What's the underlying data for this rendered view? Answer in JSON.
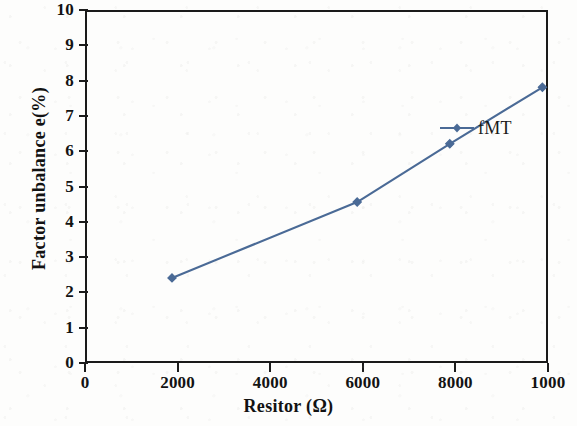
{
  "chart_data": {
    "type": "line",
    "title": "",
    "xlabel": "Resitor (Ω)",
    "ylabel": "Factor unbalance e(%)",
    "xlim": [
      0,
      10000
    ],
    "ylim": [
      0,
      10
    ],
    "xticks": [
      0,
      2000,
      4000,
      6000,
      8000,
      10000
    ],
    "xtick_labels": [
      "0",
      "2000",
      "4000",
      "6000",
      "8000",
      "1000"
    ],
    "yticks": [
      0,
      1,
      2,
      3,
      4,
      5,
      6,
      7,
      8,
      9,
      10
    ],
    "ytick_labels": [
      "0",
      "1",
      "2",
      "3",
      "4",
      "5",
      "6",
      "7",
      "8",
      "9",
      "10"
    ],
    "grid": false,
    "legend_position": "upper right inside",
    "series": [
      {
        "name": "fMT",
        "color": "#4a6a96",
        "marker": "diamond",
        "x": [
          0,
          4000,
          6000,
          8000
        ],
        "y": [
          2.75,
          4.9,
          6.55,
          8.15
        ]
      }
    ]
  },
  "legend": {
    "entries": [
      {
        "label": "fMT",
        "color": "#4a6a96"
      }
    ]
  },
  "axes": {
    "x_title": "Resitor (Ω)",
    "y_title": "Factor unbalance e(%)"
  }
}
